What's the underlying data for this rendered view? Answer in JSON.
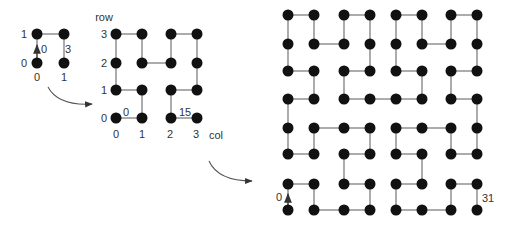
{
  "colors": {
    "dot": "#111111",
    "edge": "#888888",
    "arrow": "#333333",
    "text": "#333333",
    "background": "#ffffff"
  },
  "diagram": {
    "order1": {
      "size": 2,
      "origin": [
        37,
        63
      ],
      "spacing": [
        27,
        29
      ],
      "row_labels": [
        "0",
        "1"
      ],
      "col_labels": [
        "0",
        "1"
      ],
      "start_label": "0",
      "end_label": "3",
      "path": [
        [
          0,
          0
        ],
        [
          0,
          1
        ],
        [
          1,
          1
        ],
        [
          1,
          0
        ]
      ]
    },
    "order2": {
      "size": 4,
      "axis_row_label": "row",
      "axis_col_label": "col",
      "row_labels": [
        "0",
        "1",
        "2",
        "3"
      ],
      "col_labels": [
        "0",
        "1",
        "2",
        "3"
      ],
      "start_label": "0",
      "end_label": "15",
      "xs": [
        116,
        142,
        171,
        197
      ],
      "ys": [
        118,
        90,
        63,
        34
      ],
      "path": [
        [
          0,
          0
        ],
        [
          1,
          0
        ],
        [
          1,
          1
        ],
        [
          0,
          1
        ],
        [
          0,
          2
        ],
        [
          0,
          3
        ],
        [
          1,
          3
        ],
        [
          1,
          2
        ],
        [
          2,
          2
        ],
        [
          2,
          3
        ],
        [
          3,
          3
        ],
        [
          3,
          2
        ],
        [
          3,
          1
        ],
        [
          2,
          1
        ],
        [
          2,
          0
        ],
        [
          3,
          0
        ]
      ]
    },
    "order3": {
      "size": 8,
      "start_label": "0",
      "end_label": "31",
      "xs": [
        288,
        314,
        344,
        370,
        396,
        422,
        451,
        477
      ],
      "ys": [
        210,
        184,
        154,
        128,
        99,
        71,
        44,
        15
      ],
      "path": [
        [
          0,
          0
        ],
        [
          0,
          1
        ],
        [
          1,
          1
        ],
        [
          1,
          0
        ],
        [
          2,
          0
        ],
        [
          3,
          0
        ],
        [
          3,
          1
        ],
        [
          2,
          1
        ],
        [
          2,
          2
        ],
        [
          3,
          2
        ],
        [
          3,
          3
        ],
        [
          2,
          3
        ],
        [
          1,
          3
        ],
        [
          1,
          2
        ],
        [
          0,
          2
        ],
        [
          0,
          3
        ],
        [
          0,
          4
        ],
        [
          1,
          4
        ],
        [
          1,
          5
        ],
        [
          0,
          5
        ],
        [
          0,
          6
        ],
        [
          0,
          7
        ],
        [
          1,
          7
        ],
        [
          1,
          6
        ],
        [
          2,
          6
        ],
        [
          2,
          7
        ],
        [
          3,
          7
        ],
        [
          3,
          6
        ],
        [
          3,
          5
        ],
        [
          2,
          5
        ],
        [
          2,
          4
        ],
        [
          3,
          4
        ],
        [
          4,
          4
        ],
        [
          5,
          4
        ],
        [
          5,
          5
        ],
        [
          4,
          5
        ],
        [
          4,
          6
        ],
        [
          4,
          7
        ],
        [
          5,
          7
        ],
        [
          5,
          6
        ],
        [
          6,
          6
        ],
        [
          6,
          7
        ],
        [
          7,
          7
        ],
        [
          7,
          6
        ],
        [
          7,
          5
        ],
        [
          6,
          5
        ],
        [
          6,
          4
        ],
        [
          7,
          4
        ],
        [
          7,
          3
        ],
        [
          7,
          2
        ],
        [
          6,
          2
        ],
        [
          6,
          3
        ],
        [
          5,
          3
        ],
        [
          4,
          3
        ],
        [
          4,
          2
        ],
        [
          5,
          2
        ],
        [
          5,
          1
        ],
        [
          4,
          1
        ],
        [
          4,
          0
        ],
        [
          5,
          0
        ],
        [
          6,
          0
        ],
        [
          6,
          1
        ],
        [
          7,
          1
        ],
        [
          7,
          0
        ]
      ]
    },
    "transition_arrows": [
      {
        "from": [
          48,
          87
        ],
        "ctrl": [
          58,
          106
        ],
        "to": [
          92,
          104
        ]
      },
      {
        "from": [
          209,
          161
        ],
        "ctrl": [
          218,
          181
        ],
        "to": [
          252,
          181
        ]
      }
    ]
  }
}
